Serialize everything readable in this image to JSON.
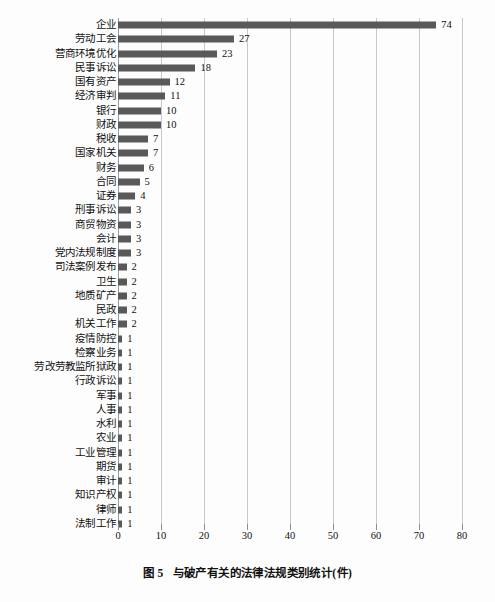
{
  "caption": {
    "figure_number": "图 5",
    "text": "与破产有关的法律法规类别统计(件)"
  },
  "axis": {
    "ticks": [
      "0",
      "10",
      "20",
      "30",
      "40",
      "50",
      "60",
      "70",
      "80"
    ]
  },
  "colors": {
    "bar": "#595959",
    "gridline": "#c9c9c9",
    "text": "#111111",
    "background": "#fdfdfd"
  },
  "chart_data": {
    "type": "bar",
    "orientation": "horizontal",
    "title": "与破产有关的法律法规类别统计(件)",
    "xlabel": "",
    "ylabel": "",
    "xlim": [
      0,
      80
    ],
    "xticks": [
      0,
      10,
      20,
      30,
      40,
      50,
      60,
      70,
      80
    ],
    "grid": true,
    "legend": false,
    "data_labels": true,
    "unit": "件",
    "categories": [
      "企业",
      "劳动工会",
      "营商环境优化",
      "民事诉讼",
      "国有资产",
      "经济审判",
      "银行",
      "财政",
      "税收",
      "国家机关",
      "财务",
      "合同",
      "证券",
      "刑事诉讼",
      "商贸物资",
      "会计",
      "党内法规制度",
      "司法案例发布",
      "卫生",
      "地质矿产",
      "民政",
      "机关工作",
      "疫情防控",
      "检察业务",
      "劳改劳教监所狱政",
      "行政诉讼",
      "军事",
      "人事",
      "水利",
      "农业",
      "工业管理",
      "期货",
      "审计",
      "知识产权",
      "律师",
      "法制工作"
    ],
    "values": [
      74,
      27,
      23,
      18,
      12,
      11,
      10,
      10,
      7,
      7,
      6,
      5,
      4,
      3,
      3,
      3,
      3,
      2,
      2,
      2,
      2,
      2,
      1,
      1,
      1,
      1,
      1,
      1,
      1,
      1,
      1,
      1,
      1,
      1,
      1,
      1
    ]
  }
}
